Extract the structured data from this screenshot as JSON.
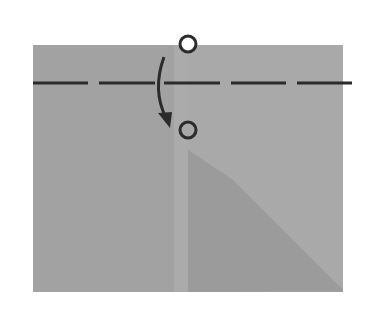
{
  "diagram": {
    "type": "origami-fold-step",
    "instruction": "Valley fold the top edge down along the dashed line, bringing the top circle to the lower circle",
    "colors": {
      "background": "#ffffff",
      "paper": "#a3a3a3",
      "paper_left": "#a1a1a1",
      "center_strip": "#adadad",
      "right_dark": "#9c9c9c",
      "right_light_triangle": "#a8a8a8",
      "ink": "#2b2b2b"
    },
    "paper": {
      "x": 33,
      "y": 45,
      "width": 310,
      "height": 247
    },
    "fold_line": {
      "style": "dashed",
      "y": 83,
      "x1": 33,
      "x2": 352
    },
    "markers": [
      {
        "name": "start-point",
        "cx": 188,
        "cy": 45,
        "r": 8
      },
      {
        "name": "end-point",
        "cx": 188,
        "cy": 130,
        "r": 8
      }
    ],
    "arrow": {
      "direction": "down",
      "from": [
        163,
        57
      ],
      "to": [
        168,
        125
      ]
    }
  }
}
